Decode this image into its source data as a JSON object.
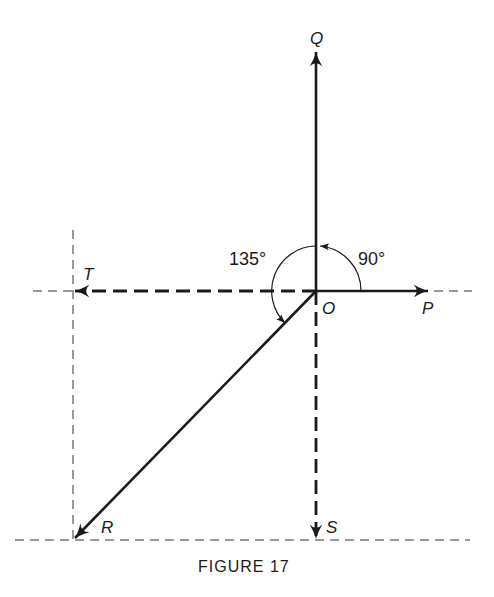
{
  "figure": {
    "caption": "FIGURE 17",
    "origin_label": "O",
    "vectors": [
      {
        "label": "Q",
        "direction": "up",
        "style": "solid"
      },
      {
        "label": "P",
        "direction": "right",
        "style": "solid"
      },
      {
        "label": "T",
        "direction": "left",
        "style": "dashed"
      },
      {
        "label": "S",
        "direction": "down",
        "style": "dashed"
      },
      {
        "label": "R",
        "direction": "down-left",
        "style": "solid"
      }
    ],
    "angles": [
      {
        "label": "90°",
        "from": "P",
        "to": "Q"
      },
      {
        "label": "135°",
        "from": "Q",
        "to": "R"
      }
    ],
    "colors": {
      "ink": "#1a1a1a",
      "background": "#ffffff"
    }
  }
}
